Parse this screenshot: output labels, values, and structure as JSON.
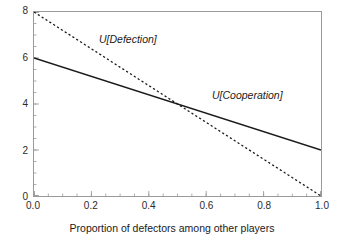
{
  "chart_data": {
    "type": "line",
    "title": "",
    "subtitle": "",
    "xlabel": "Proportion of defectors among other players",
    "ylabel": "",
    "xlim": [
      0.0,
      1.0
    ],
    "ylim": [
      0.0,
      8.0
    ],
    "grid": false,
    "legend_position": "inline-annotations",
    "x": [
      0.0,
      1.0
    ],
    "xticks": [
      0.0,
      0.2,
      0.4,
      0.6,
      0.8,
      1.0
    ],
    "xticklabels": [
      "0.0",
      "0.2",
      "0.4",
      "0.6",
      "0.8",
      "1.0"
    ],
    "xminor_step": 0.05,
    "yticks": [
      0,
      2,
      4,
      6,
      8
    ],
    "yticklabels": [
      "0",
      "2",
      "4",
      "6",
      "8"
    ],
    "yminor_step": 0.5,
    "series": [
      {
        "name": "U[Defection]",
        "label": "U[Defection]",
        "style": "dashed",
        "color": "#1a1a1a",
        "x": [
          0.0,
          1.0
        ],
        "values": [
          8.0,
          0.0
        ]
      },
      {
        "name": "U[Cooperation]",
        "label": "U[Cooperation]",
        "style": "solid",
        "color": "#1a1a1a",
        "x": [
          0.0,
          1.0
        ],
        "values": [
          6.0,
          2.0
        ]
      }
    ],
    "annotations": [
      {
        "text": "U[Defection]",
        "x": 0.27,
        "y": 6.55
      },
      {
        "text": "U[Cooperation]",
        "x": 0.66,
        "y": 4.25
      }
    ],
    "intersection": {
      "x": 0.5,
      "y": 4.0
    }
  },
  "figure": {
    "background_color": "#ffffff",
    "frame_color": "#9a9a9a",
    "text_color": "#1a1a1a"
  }
}
